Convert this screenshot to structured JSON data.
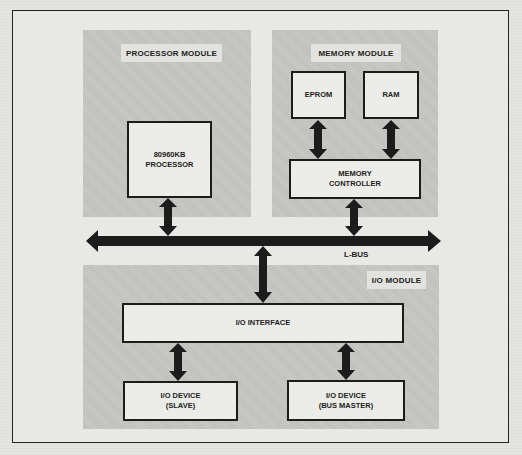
{
  "diagram": {
    "modules": {
      "processor": {
        "label": "PROCESSOR MODULE",
        "blocks": {
          "cpu": {
            "line1": "80960KB",
            "line2": "PROCESSOR"
          }
        }
      },
      "memory": {
        "label": "MEMORY MODULE",
        "blocks": {
          "eprom": {
            "line1": "EPROM"
          },
          "ram": {
            "line1": "RAM"
          },
          "controller": {
            "line1": "MEMORY",
            "line2": "CONTROLLER"
          }
        }
      },
      "io": {
        "label": "I/O MODULE",
        "blocks": {
          "interface": {
            "line1": "I/O INTERFACE"
          },
          "slave": {
            "line1": "I/O DEVICE",
            "line2": "(SLAVE)"
          },
          "bus_master": {
            "line1": "I/O DEVICE",
            "line2": "(BUS MASTER)"
          }
        }
      }
    },
    "bus": {
      "label": "L-BUS"
    },
    "connections": [
      {
        "from": "80960KB PROCESSOR",
        "to": "L-BUS",
        "type": "bidirectional"
      },
      {
        "from": "EPROM",
        "to": "MEMORY CONTROLLER",
        "type": "bidirectional"
      },
      {
        "from": "RAM",
        "to": "MEMORY CONTROLLER",
        "type": "bidirectional"
      },
      {
        "from": "MEMORY CONTROLLER",
        "to": "L-BUS",
        "type": "bidirectional"
      },
      {
        "from": "L-BUS",
        "to": "I/O INTERFACE",
        "type": "bidirectional"
      },
      {
        "from": "I/O INTERFACE",
        "to": "I/O DEVICE (SLAVE)",
        "type": "bidirectional"
      },
      {
        "from": "I/O INTERFACE",
        "to": "I/O DEVICE (BUS MASTER)",
        "type": "bidirectional"
      }
    ],
    "colors": {
      "module_fill": "#c9c9c6",
      "block_fill": "#ecece8",
      "stroke": "#1c1c1c"
    }
  }
}
